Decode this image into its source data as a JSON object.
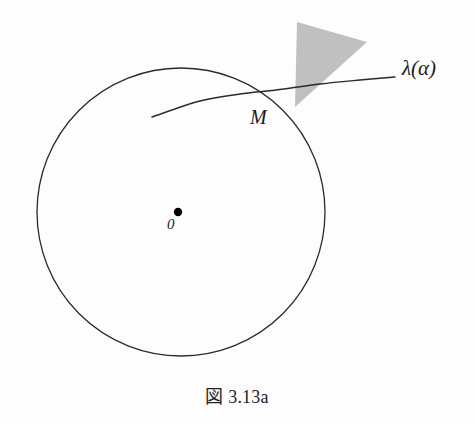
{
  "figure": {
    "caption": "図 3.13a",
    "background_color": "#fdfdfd",
    "stroke_color": "#2a2a2a",
    "shade_color": "#c0c0c0",
    "labels": {
      "tangent_curve": "λ(α)",
      "tangency_point": "M",
      "center_point": "0"
    }
  },
  "chart_data": {
    "type": "scatter",
    "title": "図 3.13a",
    "xlabel": "",
    "ylabel": "",
    "grid": false,
    "legend": "none",
    "xlim": [
      0,
      474
    ],
    "ylim": [
      0,
      425
    ],
    "elements": [
      {
        "name": "circle",
        "shape": "circle",
        "center_x": 181,
        "center_y": 212,
        "radius": 144,
        "fill": "none",
        "stroke": "#2a2a2a",
        "stroke_width": 1.3
      },
      {
        "name": "center-dot",
        "shape": "point",
        "x": 178,
        "y": 212,
        "radius": 4.2,
        "fill": "#000000"
      },
      {
        "name": "tangent-curve",
        "shape": "curve",
        "points": [
          [
            152,
            117
          ],
          [
            200,
            101
          ],
          [
            240,
            94
          ],
          [
            276,
            90
          ],
          [
            320,
            84
          ],
          [
            360,
            80
          ],
          [
            395,
            77
          ]
        ],
        "stroke": "#2a2a2a",
        "stroke_width": 1.4
      },
      {
        "name": "shaded-cone",
        "shape": "polygon",
        "points": [
          [
            295,
            107
          ],
          [
            297,
            22
          ],
          [
            367,
            42
          ]
        ],
        "fill": "#c0c0c0",
        "stroke": "none"
      }
    ],
    "annotations": [
      {
        "text": "λ(α)",
        "x": 410,
        "y": 70
      },
      {
        "text": "M",
        "x": 258,
        "y": 120
      },
      {
        "text": "0",
        "x": 172,
        "y": 226
      }
    ]
  }
}
